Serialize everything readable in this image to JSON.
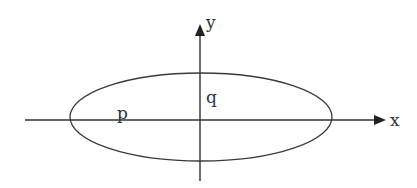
{
  "diagram": {
    "title": "",
    "stroke_color": "#333333",
    "background": "#ffffff",
    "axes": {
      "x": {
        "label": "x",
        "from": [
          25,
          120
        ],
        "to": [
          385,
          120
        ]
      },
      "y": {
        "label": "y",
        "from": [
          200,
          181
        ],
        "to": [
          200,
          24
        ]
      }
    },
    "ellipse": {
      "cx": 201,
      "cy": 117,
      "rx": 131,
      "ry": 44
    },
    "labels": {
      "semi_major": "p",
      "semi_minor": "q"
    }
  }
}
